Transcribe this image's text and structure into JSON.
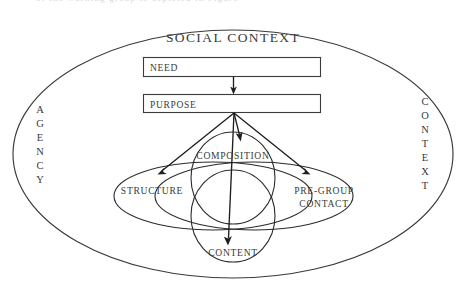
{
  "figure": {
    "title": "SOCIAL CONTEXT",
    "cropped_top_line": "of the working group is depicted in Figure",
    "outer_label_left": "AGENCY",
    "outer_label_right": "CONTEXT",
    "boxes": [
      {
        "label": "NEED"
      },
      {
        "label": "PURPOSE"
      }
    ],
    "lobes": [
      {
        "label": "COMPOSITION"
      },
      {
        "label": "STRUCTURE"
      },
      {
        "label": "PRE-GROUP",
        "label2": "CONTACT"
      },
      {
        "label": "CONTENT"
      }
    ],
    "colors": {
      "stroke": "#2b2b2b",
      "text": "#3a3a3a",
      "background": "#ffffff"
    }
  }
}
